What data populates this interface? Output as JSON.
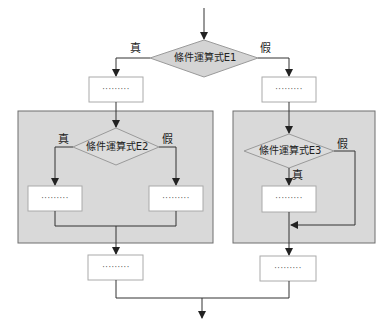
{
  "diagram": {
    "type": "flowchart",
    "decisions": {
      "e1": {
        "label": "條件運算式E1"
      },
      "e2": {
        "label": "條件運算式E2"
      },
      "e3": {
        "label": "條件運算式E3"
      }
    },
    "branch_labels": {
      "e1_true": "真",
      "e1_false": "假",
      "e2_true": "真",
      "e2_false": "假",
      "e3_true": "真",
      "e3_false": "假"
    },
    "process_boxes": {
      "top_left": "·········",
      "top_right": "·········",
      "e2_true": "·········",
      "e2_false": "·········",
      "e3_true": "·········",
      "bottom_left": "·········",
      "bottom_right": "·········"
    },
    "colors": {
      "panel_fill": "#d9d9d9",
      "panel_border": "#6e6e6e",
      "diamond_fill": "#d4d4d4",
      "box_fill": "#ffffff",
      "line": "#333333"
    }
  }
}
